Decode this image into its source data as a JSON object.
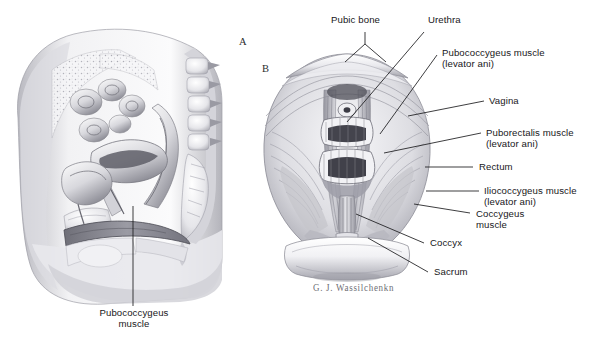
{
  "figure": {
    "background": "#ffffff",
    "ink": "#17171a",
    "signature": "G. J. Wassilchenkn",
    "panels": [
      {
        "mark": "A",
        "caption": "Pubococcygeus\nmuscle",
        "view": "midsagittal-female-pelvis"
      },
      {
        "mark": "B",
        "caption": "",
        "view": "superior-pelvic-floor"
      }
    ]
  },
  "panel_a": {
    "mark": "A",
    "label": "Pubococcygeus\nmuscle"
  },
  "panel_b": {
    "mark": "B",
    "labels": [
      {
        "id": "pubic-bone",
        "text": "Pubic bone"
      },
      {
        "id": "urethra",
        "text": "Urethra"
      },
      {
        "id": "pubococcygeus-muscle",
        "text": "Pubococcygeus muscle\n(levator ani)"
      },
      {
        "id": "vagina",
        "text": "Vagina"
      },
      {
        "id": "puborectalis-muscle",
        "text": "Puborectalis muscle\n(levator ani)"
      },
      {
        "id": "rectum",
        "text": "Rectum"
      },
      {
        "id": "iliococcygeus-muscle",
        "text": "Iliococcygeus muscle\n(levator ani)"
      },
      {
        "id": "coccygeus-muscle",
        "text": "Coccygeus\nmuscle"
      },
      {
        "id": "coccyx",
        "text": "Coccyx"
      },
      {
        "id": "sacrum",
        "text": "Sacrum"
      }
    ]
  }
}
